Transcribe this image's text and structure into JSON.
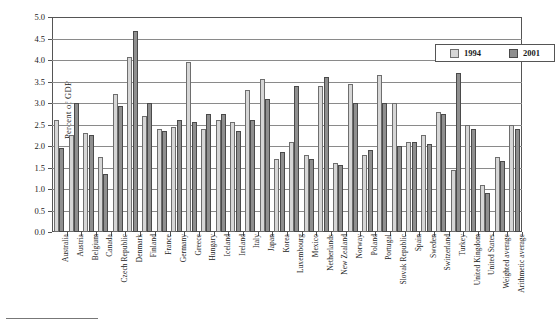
{
  "chart_data": {
    "type": "bar",
    "title": "",
    "xlabel": "",
    "ylabel": "Percent of GDP",
    "ylim": [
      0.0,
      5.0
    ],
    "ytick_labels": [
      "0.0",
      "0.5",
      "1.0",
      "1.5",
      "2.0",
      "2.5",
      "3.0",
      "3.5",
      "4.0",
      "4.5",
      "5.0"
    ],
    "ytick_values": [
      0.0,
      0.5,
      1.0,
      1.5,
      2.0,
      2.5,
      3.0,
      3.5,
      4.0,
      4.5,
      5.0
    ],
    "grid": true,
    "legend_position": "top-right",
    "categories": [
      "Australia",
      "Austria",
      "Belgium",
      "Canada",
      "Czech Republic",
      "Denmark",
      "Finland",
      "France",
      "Germany",
      "Greece",
      "Hungary",
      "Iceland",
      "Ireland",
      "Italy",
      "Japan",
      "Korea",
      "Luxembourg",
      "Mexico",
      "Netherlands",
      "New Zealand",
      "Norway",
      "Poland",
      "Portugal",
      "Slovak Republic",
      "Spain",
      "Sweden",
      "Switzerland",
      "Turkey",
      "United Kingdom",
      "United States",
      "Weighted average",
      "Arithmetic average"
    ],
    "series": [
      {
        "name": "1994",
        "color": "#d6d6d6",
        "values": [
          2.6,
          2.25,
          2.3,
          1.75,
          3.22,
          4.07,
          2.7,
          2.4,
          2.45,
          3.95,
          2.4,
          2.6,
          2.55,
          3.3,
          3.55,
          1.7,
          2.1,
          1.8,
          3.4,
          1.6,
          3.45,
          1.8,
          3.65,
          3.0,
          2.1,
          2.25,
          2.8,
          1.45,
          2.5,
          1.1,
          1.75,
          2.5
        ]
      },
      {
        "name": "2001",
        "color": "#8f8f8f",
        "values": [
          1.95,
          3.0,
          2.25,
          1.35,
          2.93,
          4.68,
          3.0,
          2.35,
          2.6,
          2.55,
          2.75,
          2.75,
          2.35,
          2.6,
          3.1,
          1.85,
          3.4,
          1.7,
          3.6,
          1.55,
          3.0,
          1.9,
          3.0,
          2.0,
          2.1,
          2.05,
          2.75,
          3.7,
          2.4,
          0.9,
          1.65,
          2.4
        ]
      }
    ]
  },
  "legend": {
    "items": [
      {
        "label": "1994",
        "swatch": "light-gray"
      },
      {
        "label": "2001",
        "swatch": "dark-gray"
      }
    ]
  }
}
